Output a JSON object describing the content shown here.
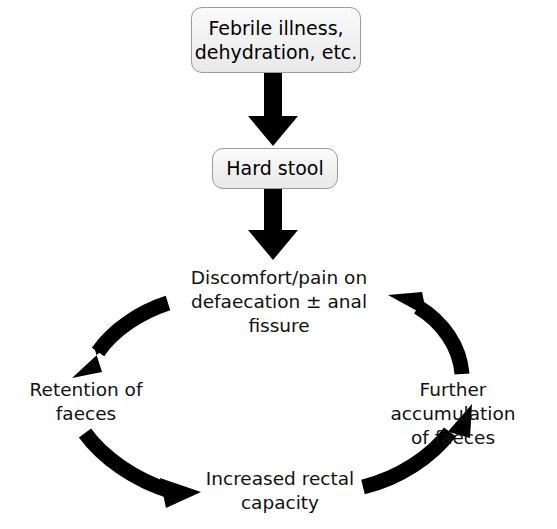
{
  "diagram": {
    "background_color": "#ffffff",
    "text_color": "#111111",
    "arrow_color": "#000000",
    "box_border_color": "#9b9b9b",
    "box_fill_color": "#f2f2f2",
    "nodes": [
      {
        "id": "febrile",
        "type": "box",
        "label": "Febrile illness,\ndehydration, etc."
      },
      {
        "id": "hard_stool",
        "type": "box",
        "label": "Hard stool"
      },
      {
        "id": "discomfort",
        "type": "text",
        "label": "Discomfort/pain on\ndefaecation ± anal fissure"
      },
      {
        "id": "retention",
        "type": "text",
        "label": "Retention of\nfaeces"
      },
      {
        "id": "further_accumulation",
        "type": "text",
        "label": "Further accumulation\nof faeces"
      },
      {
        "id": "increased_capacity",
        "type": "text",
        "label": "Increased rectal\ncapacity"
      }
    ],
    "edges": [
      {
        "id": "e1",
        "from": "febrile",
        "to": "hard_stool",
        "style": "straight-down"
      },
      {
        "id": "e2",
        "from": "hard_stool",
        "to": "discomfort",
        "style": "straight-down"
      },
      {
        "id": "e3",
        "from": "discomfort",
        "to": "retention",
        "style": "curved-ccw"
      },
      {
        "id": "e4",
        "from": "retention",
        "to": "increased_capacity",
        "style": "curved-ccw"
      },
      {
        "id": "e5",
        "from": "increased_capacity",
        "to": "further_accumulation",
        "style": "curved-ccw"
      },
      {
        "id": "e6",
        "from": "further_accumulation",
        "to": "discomfort",
        "style": "curved-ccw"
      }
    ]
  }
}
